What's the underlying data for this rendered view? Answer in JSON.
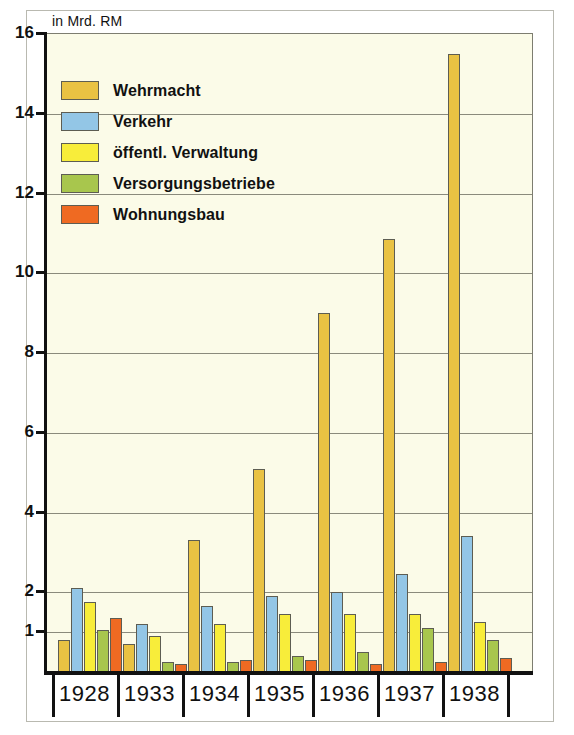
{
  "chart_data": {
    "type": "bar",
    "title": "",
    "subtitle": "",
    "unit_label": "in Mrd. RM",
    "xlabel": "",
    "ylabel": "in Mrd. RM",
    "categories": [
      "1928",
      "1933",
      "1934",
      "1935",
      "1936",
      "1937",
      "1938"
    ],
    "ylim": [
      0,
      16
    ],
    "yticks": [
      16,
      14,
      12,
      10,
      8,
      6,
      4,
      2,
      1
    ],
    "ytick_labels": [
      "16",
      "14",
      "12",
      "10",
      "8",
      "6",
      "4",
      "2",
      "1"
    ],
    "gridlines": [
      16,
      14,
      12,
      10,
      8,
      6,
      4,
      2,
      1
    ],
    "grid": true,
    "legend_position": "top-left",
    "series": [
      {
        "name": "Wehrmacht",
        "color": "#e9c243",
        "values": [
          0.8,
          0.7,
          3.3,
          5.1,
          9.0,
          10.85,
          15.5
        ]
      },
      {
        "name": "Verkehr",
        "color": "#93c6e6",
        "values": [
          2.1,
          1.2,
          1.65,
          1.9,
          2.0,
          2.45,
          3.4
        ]
      },
      {
        "name": "öffentl. Verwaltung",
        "color": "#f8ed3a",
        "values": [
          1.75,
          0.9,
          1.2,
          1.45,
          1.45,
          1.45,
          1.25
        ]
      },
      {
        "name": "Versorgungsbetriebe",
        "color": "#a8c64d",
        "values": [
          1.05,
          0.25,
          0.25,
          0.4,
          0.5,
          1.1,
          0.8
        ]
      },
      {
        "name": "Wohnungsbau",
        "color": "#ef6a22",
        "values": [
          1.35,
          0.2,
          0.3,
          0.3,
          0.2,
          0.25,
          0.35
        ]
      }
    ]
  },
  "legend": {
    "items": [
      {
        "label": "Wehrmacht",
        "color": "#e9c243"
      },
      {
        "label": "Verkehr",
        "color": "#93c6e6"
      },
      {
        "label": "öffentl. Verwaltung",
        "color": "#f8ed3a"
      },
      {
        "label": "Versorgungsbetriebe",
        "color": "#a8c64d"
      },
      {
        "label": "Wohnungsbau",
        "color": "#ef6a22"
      }
    ]
  }
}
